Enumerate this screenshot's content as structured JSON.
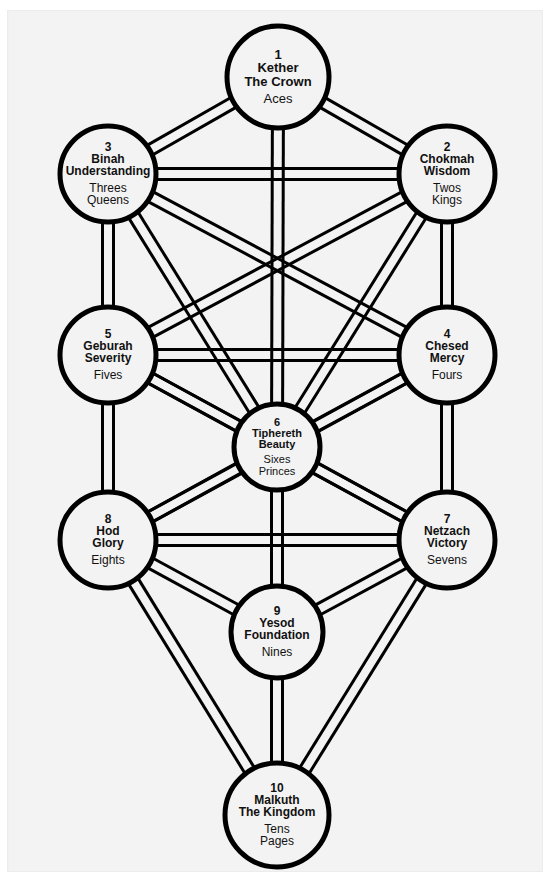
{
  "diagram": {
    "background_color": "#f3f3f3",
    "page_color": "#ffffff",
    "stroke_color": "#000000",
    "text_color": "#111111"
  },
  "nodes": [
    {
      "id": "kether",
      "number": "1",
      "hebrew_name": "Kether",
      "translation": "The Crown",
      "tarot_lines": [
        "Aces"
      ],
      "cx": 278,
      "cy": 77,
      "r": 51,
      "font_size": 13
    },
    {
      "id": "chokmah",
      "number": "2",
      "hebrew_name": "Chokmah",
      "translation": "Wisdom",
      "tarot_lines": [
        "Twos",
        "Kings"
      ],
      "cx": 447,
      "cy": 174,
      "r": 48,
      "font_size": 12
    },
    {
      "id": "binah",
      "number": "3",
      "hebrew_name": "Binah",
      "translation": "Understanding",
      "tarot_lines": [
        "Threes",
        "Queens"
      ],
      "cx": 108,
      "cy": 174,
      "r": 48,
      "font_size": 12
    },
    {
      "id": "chesed",
      "number": "4",
      "hebrew_name": "Chesed",
      "translation": "Mercy",
      "tarot_lines": [
        "Fours"
      ],
      "cx": 447,
      "cy": 355,
      "r": 48,
      "font_size": 12
    },
    {
      "id": "geburah",
      "number": "5",
      "hebrew_name": "Geburah",
      "translation": "Severity",
      "tarot_lines": [
        "Fives"
      ],
      "cx": 108,
      "cy": 355,
      "r": 48,
      "font_size": 12
    },
    {
      "id": "tiphereth",
      "number": "6",
      "hebrew_name": "Tiphereth",
      "translation": "Beauty",
      "tarot_lines": [
        "Sixes",
        "Princes"
      ],
      "cx": 277,
      "cy": 447,
      "r": 43,
      "font_size": 11
    },
    {
      "id": "netzach",
      "number": "7",
      "hebrew_name": "Netzach",
      "translation": "Victory",
      "tarot_lines": [
        "Sevens"
      ],
      "cx": 447,
      "cy": 540,
      "r": 48,
      "font_size": 12
    },
    {
      "id": "hod",
      "number": "8",
      "hebrew_name": "Hod",
      "translation": "Glory",
      "tarot_lines": [
        "Eights"
      ],
      "cx": 108,
      "cy": 540,
      "r": 48,
      "font_size": 12
    },
    {
      "id": "yesod",
      "number": "9",
      "hebrew_name": "Yesod",
      "translation": "Foundation",
      "tarot_lines": [
        "Nines"
      ],
      "cx": 277,
      "cy": 632,
      "r": 46,
      "font_size": 12
    },
    {
      "id": "malkuth",
      "number": "10",
      "hebrew_name": "Malkuth",
      "translation": "The Kingdom",
      "tarot_lines": [
        "Tens",
        "Pages"
      ],
      "cx": 277,
      "cy": 815,
      "r": 52,
      "font_size": 12
    }
  ],
  "paths": [
    {
      "from": "kether",
      "to": "chokmah"
    },
    {
      "from": "kether",
      "to": "binah"
    },
    {
      "from": "kether",
      "to": "tiphereth"
    },
    {
      "from": "chokmah",
      "to": "binah"
    },
    {
      "from": "chokmah",
      "to": "chesed"
    },
    {
      "from": "chokmah",
      "to": "geburah"
    },
    {
      "from": "chokmah",
      "to": "tiphereth"
    },
    {
      "from": "binah",
      "to": "geburah"
    },
    {
      "from": "binah",
      "to": "chesed"
    },
    {
      "from": "binah",
      "to": "tiphereth"
    },
    {
      "from": "chesed",
      "to": "geburah"
    },
    {
      "from": "chesed",
      "to": "tiphereth"
    },
    {
      "from": "chesed",
      "to": "netzach"
    },
    {
      "from": "geburah",
      "to": "tiphereth"
    },
    {
      "from": "geburah",
      "to": "hod"
    },
    {
      "from": "geburah",
      "to": "netzach"
    },
    {
      "from": "chesed",
      "to": "hod"
    },
    {
      "from": "tiphereth",
      "to": "netzach"
    },
    {
      "from": "tiphereth",
      "to": "hod"
    },
    {
      "from": "tiphereth",
      "to": "yesod"
    },
    {
      "from": "tiphereth",
      "to": "malkuth"
    },
    {
      "from": "netzach",
      "to": "hod"
    },
    {
      "from": "netzach",
      "to": "yesod"
    },
    {
      "from": "netzach",
      "to": "malkuth"
    },
    {
      "from": "hod",
      "to": "yesod"
    },
    {
      "from": "hod",
      "to": "malkuth"
    },
    {
      "from": "yesod",
      "to": "malkuth"
    }
  ],
  "path_style": {
    "ribbon_width": 11,
    "line_width": 3,
    "node_line_width": 5
  }
}
